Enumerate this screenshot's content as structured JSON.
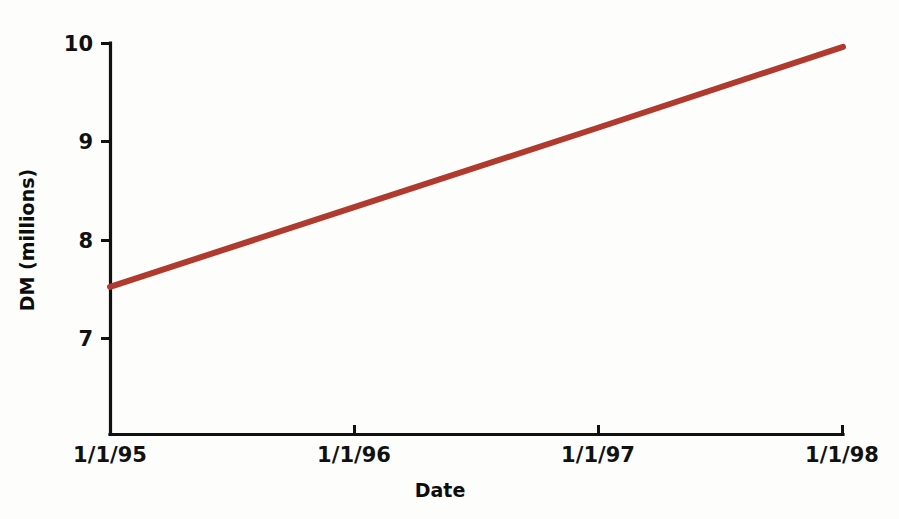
{
  "chart_data": {
    "type": "line",
    "title": "",
    "xlabel": "Date",
    "ylabel": "DM (millions)",
    "x": [
      "1/1/95",
      "1/1/96",
      "1/1/97",
      "1/1/98"
    ],
    "xtick_labels": [
      "1/1/95",
      "1/1/96",
      "1/1/97",
      "1/1/98"
    ],
    "ytick_labels": [
      "10",
      "9",
      "8",
      "7"
    ],
    "ylim": [
      6.5,
      10.0
    ],
    "yticks": [
      7,
      8,
      9,
      10
    ],
    "grid": false,
    "legend": "none",
    "series": [
      {
        "name": "DM (millions)",
        "color": "#b13a2f",
        "values": [
          7.52,
          8.33,
          9.14,
          9.96
        ]
      }
    ]
  },
  "axes": {
    "y_title": "DM (millions)",
    "x_title": "Date",
    "y_ticks": [
      {
        "label": "10",
        "value": 10
      },
      {
        "label": "9",
        "value": 9
      },
      {
        "label": "8",
        "value": 8
      },
      {
        "label": "7",
        "value": 7
      }
    ],
    "x_ticks": [
      {
        "label": "1/1/95"
      },
      {
        "label": "1/1/96"
      },
      {
        "label": "1/1/97"
      },
      {
        "label": "1/1/98"
      }
    ]
  },
  "colors": {
    "line": "#b13a2f",
    "axis": "#111111",
    "background": "#fdfdfc",
    "text": "#111111"
  }
}
